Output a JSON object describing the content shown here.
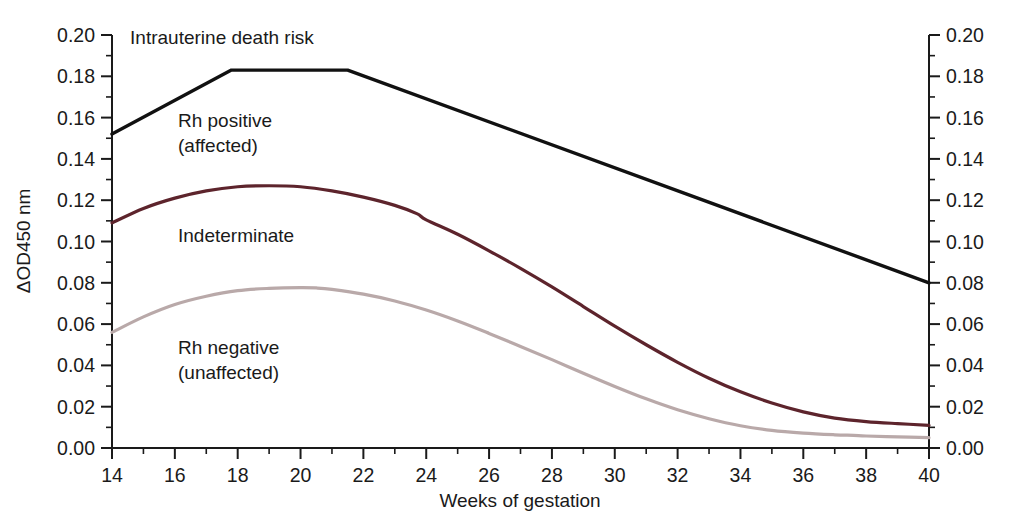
{
  "chart_data": {
    "type": "line",
    "title": "",
    "xlabel": "Weeks of gestation",
    "ylabel": "ΔOD450 nm",
    "ylabel_right": "",
    "xlim": [
      14,
      40
    ],
    "ylim": [
      0.0,
      0.2
    ],
    "grid": false,
    "legend_position": "inline-annotations",
    "x_ticks": [
      14,
      16,
      18,
      20,
      22,
      24,
      26,
      28,
      30,
      32,
      34,
      36,
      38,
      40
    ],
    "x_tick_labels": [
      "14",
      "16",
      "18",
      "20",
      "22",
      "24",
      "26",
      "28",
      "30",
      "32",
      "34",
      "36",
      "38",
      "40"
    ],
    "x_minor_ticks": [
      15,
      17,
      19,
      21,
      23,
      25,
      27,
      29,
      31,
      33,
      35,
      37,
      39
    ],
    "y_ticks": [
      0.0,
      0.02,
      0.04,
      0.06,
      0.08,
      0.1,
      0.12,
      0.14,
      0.16,
      0.18,
      0.2
    ],
    "y_tick_labels": [
      "0.00",
      "0.02",
      "0.04",
      "0.06",
      "0.08",
      "0.10",
      "0.12",
      "0.14",
      "0.16",
      "0.18",
      "0.20"
    ],
    "y_minor_ticks": [
      0.01,
      0.03,
      0.05,
      0.07,
      0.09,
      0.11,
      0.13,
      0.15,
      0.17,
      0.19
    ],
    "series": [
      {
        "name": "Intrauterine death risk boundary",
        "color": "#111111",
        "width": 3.4,
        "x": [
          14,
          17.8,
          21.5,
          40
        ],
        "values": [
          0.152,
          0.183,
          0.183,
          0.08
        ]
      },
      {
        "name": "Rh positive (affected) lower boundary",
        "color": "#5d242c",
        "width": 3.2,
        "x": [
          14,
          15,
          16,
          17,
          18,
          19,
          20,
          21,
          22,
          23,
          23.7,
          24,
          25,
          26,
          27,
          28,
          29,
          30,
          31,
          32,
          33,
          34,
          35,
          36,
          37,
          38,
          39,
          40
        ],
        "values": [
          0.109,
          0.116,
          0.121,
          0.1245,
          0.1265,
          0.127,
          0.1265,
          0.1245,
          0.1215,
          0.1175,
          0.1135,
          0.1105,
          0.1035,
          0.0955,
          0.087,
          0.078,
          0.0685,
          0.059,
          0.05,
          0.0415,
          0.0338,
          0.0272,
          0.0218,
          0.0175,
          0.0145,
          0.0128,
          0.0118,
          0.011
        ]
      },
      {
        "name": "Rh negative (unaffected) lower boundary",
        "color": "#b9a9a9",
        "width": 3.2,
        "x": [
          14,
          15,
          16,
          17,
          18,
          19,
          20,
          20.5,
          21,
          22,
          23,
          24,
          25,
          26,
          27,
          28,
          29,
          30,
          31,
          32,
          33,
          34,
          35,
          36,
          37,
          37.6,
          38,
          39,
          40
        ],
        "values": [
          0.056,
          0.0635,
          0.0695,
          0.0735,
          0.0762,
          0.0773,
          0.0777,
          0.0775,
          0.0768,
          0.0745,
          0.0712,
          0.0668,
          0.0615,
          0.0555,
          0.0492,
          0.0428,
          0.0362,
          0.0298,
          0.0238,
          0.0185,
          0.0142,
          0.0108,
          0.0085,
          0.0072,
          0.0064,
          0.0061,
          0.0058,
          0.0054,
          0.005
        ]
      }
    ],
    "annotations": [
      {
        "text": "Intrauterine death risk",
        "x": 17.5,
        "y": 0.1955,
        "anchor": "middle"
      },
      {
        "text": "Rh positive",
        "x": 16.1,
        "y": 0.1555,
        "anchor": "start"
      },
      {
        "text": "(affected)",
        "x": 16.1,
        "y": 0.1435,
        "anchor": "start"
      },
      {
        "text": "Indeterminate",
        "x": 16.1,
        "y": 0.1,
        "anchor": "start"
      },
      {
        "text": "Rh negative",
        "x": 16.1,
        "y": 0.0455,
        "anchor": "start"
      },
      {
        "text": "(unaffected)",
        "x": 16.1,
        "y": 0.0335,
        "anchor": "start"
      }
    ]
  },
  "axes": {
    "x_title": "Weeks of gestation",
    "y_title": "ΔOD450 nm"
  },
  "colors": {
    "death_risk_line": "#111111",
    "rh_positive_line": "#5d242c",
    "rh_negative_line": "#b9a9a9",
    "axis": "#1a1a1a",
    "background": "#ffffff"
  }
}
